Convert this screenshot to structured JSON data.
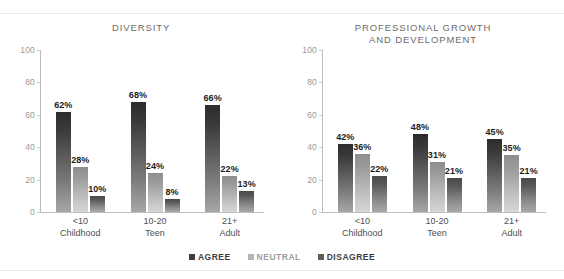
{
  "chart_data": [
    {
      "type": "bar",
      "title": "DIVERSITY",
      "title_lines": [
        "DIVERSITY"
      ],
      "xlabel": "",
      "ylabel": "",
      "ylim": [
        0,
        100
      ],
      "yticks": [
        100,
        80,
        60,
        40,
        20,
        0
      ],
      "grid": false,
      "legend_position": "bottom-center-shared",
      "categories": [
        "<10 Childhood",
        "10-20 Teen",
        "21+ Adult"
      ],
      "category_lines": [
        {
          "line1": "<10",
          "line2": "Childhood"
        },
        {
          "line1": "10-20",
          "line2": "Teen"
        },
        {
          "line1": "21+",
          "line2": "Adult"
        }
      ],
      "series": [
        {
          "name": "AGREE",
          "values": [
            62,
            68,
            66
          ],
          "labels": [
            "62%",
            "68%",
            "66%"
          ],
          "color": "#2c2c2c"
        },
        {
          "name": "NEUTRAL",
          "values": [
            28,
            24,
            22
          ],
          "labels": [
            "28%",
            "24%",
            "22%"
          ],
          "color": "#b5b5b5"
        },
        {
          "name": "DISAGREE",
          "values": [
            10,
            8,
            13
          ],
          "labels": [
            "10%",
            "8%",
            "13%"
          ],
          "color": "#5c5c5c"
        }
      ]
    },
    {
      "type": "bar",
      "title": "PROFESSIONAL GROWTH AND DEVELOPMENT",
      "title_lines": [
        "PROFESSIONAL GROWTH",
        "AND DEVELOPMENT"
      ],
      "xlabel": "",
      "ylabel": "",
      "ylim": [
        0,
        100
      ],
      "yticks": [
        100,
        80,
        60,
        40,
        20,
        0
      ],
      "grid": false,
      "legend_position": "bottom-center-shared",
      "categories": [
        "<10 Childhood",
        "10-20 Teen",
        "21+ Adult"
      ],
      "category_lines": [
        {
          "line1": "<10",
          "line2": "Childhood"
        },
        {
          "line1": "10-20",
          "line2": "Teen"
        },
        {
          "line1": "21+",
          "line2": "Adult"
        }
      ],
      "series": [
        {
          "name": "AGREE",
          "values": [
            42,
            48,
            45
          ],
          "labels": [
            "42%",
            "48%",
            "45%"
          ],
          "color": "#2c2c2c"
        },
        {
          "name": "NEUTRAL",
          "values": [
            36,
            31,
            35
          ],
          "labels": [
            "36%",
            "31%",
            "35%"
          ],
          "color": "#b5b5b5"
        },
        {
          "name": "DISAGREE",
          "values": [
            22,
            21,
            21
          ],
          "labels": [
            "22%",
            "21%",
            "21%"
          ],
          "color": "#5c5c5c"
        }
      ]
    }
  ],
  "legend": {
    "items": [
      {
        "label": "AGREE",
        "color": "#3d3d3d"
      },
      {
        "label": "NEUTRAL",
        "color": "#b5b5b5"
      },
      {
        "label": "DISAGREE",
        "color": "#5c5c5c"
      }
    ]
  }
}
